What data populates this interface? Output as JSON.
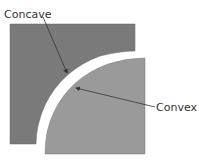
{
  "labels": {
    "concave": "Concave",
    "convex": "Convex"
  },
  "colors": {
    "background": "#ffffff",
    "concave_shape": "#7a7a7a",
    "convex_shape": "#9a9a9a",
    "outline": "#666666",
    "arrow": "#333333",
    "text": "#333333"
  }
}
